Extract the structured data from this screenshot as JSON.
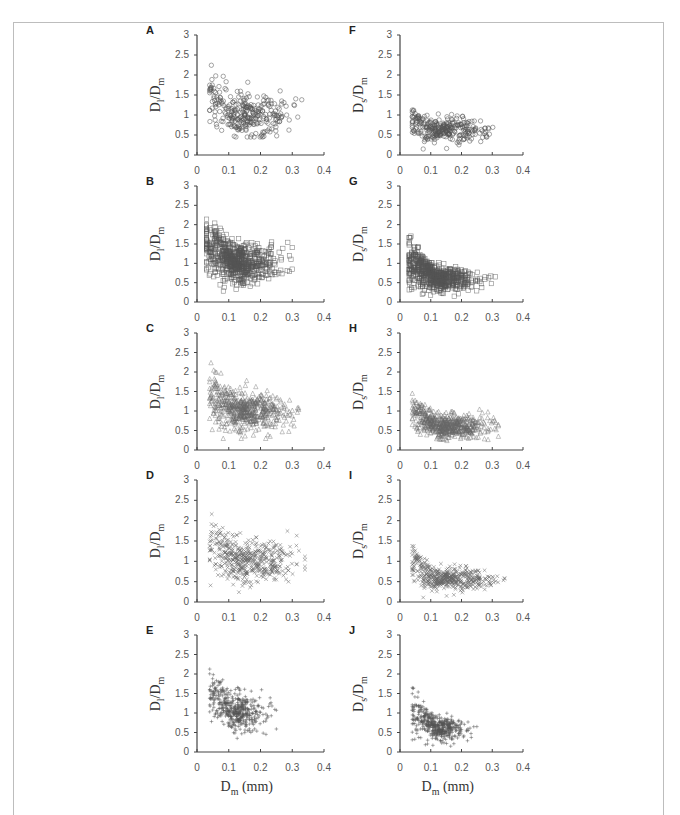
{
  "figure": {
    "x_axis_label_main": "D",
    "x_axis_label_sub": "m",
    "x_axis_label_unit": " (mm)",
    "left_y_main": "D",
    "left_y_sub": "l",
    "left_y_den": "/D",
    "left_y_den_sub": "m",
    "right_y_main": "D",
    "right_y_sub": "s",
    "right_y_den": "/D",
    "right_y_den_sub": "m"
  },
  "chart_data": [
    {
      "panel": "A",
      "type": "scatter",
      "marker": "circle",
      "ylabel": "Dl/Dm",
      "xlabel": "",
      "xlim": [
        0,
        0.4
      ],
      "ylim": [
        0,
        3
      ],
      "xticks": [
        "0",
        "0.1",
        "0.2",
        "0.3",
        "0.4"
      ],
      "yticks": [
        "0",
        "0.5",
        "1",
        "1.5",
        "2",
        "2.5",
        "3"
      ],
      "x_range": [
        0.04,
        0.33
      ],
      "y_range": [
        0.45,
        2.65
      ],
      "center": [
        0.17,
        1.0
      ],
      "description": "Dense cluster near y≈1 for x 0.1–0.3; higher values (up to ~2.65) at x≈0.05–0.1"
    },
    {
      "panel": "B",
      "type": "scatter",
      "marker": "square",
      "ylabel": "Dl/Dm",
      "xlabel": "",
      "xlim": [
        0,
        0.4
      ],
      "ylim": [
        0,
        3
      ],
      "xticks": [
        "0",
        "0.1",
        "0.2",
        "0.3",
        "0.4"
      ],
      "yticks": [
        "0",
        "0.5",
        "1",
        "1.5",
        "2",
        "2.5",
        "3"
      ],
      "x_range": [
        0.03,
        0.3
      ],
      "y_range": [
        0.15,
        2.6
      ],
      "center": [
        0.13,
        1.0
      ],
      "description": "Very dense cluster; decreasing trend from ~2.5 at x≈0.04 to ~1 at x≈0.25"
    },
    {
      "panel": "C",
      "type": "scatter",
      "marker": "triangle",
      "ylabel": "Dl/Dm",
      "xlabel": "",
      "xlim": [
        0,
        0.4
      ],
      "ylim": [
        0,
        3
      ],
      "xticks": [
        "0",
        "0.1",
        "0.2",
        "0.3",
        "0.4"
      ],
      "yticks": [
        "0",
        "0.5",
        "1",
        "1.5",
        "2",
        "2.5",
        "3"
      ],
      "x_range": [
        0.04,
        0.32
      ],
      "y_range": [
        0.3,
        2.65
      ],
      "center": [
        0.17,
        1.0
      ],
      "description": "Dense cluster near y≈1 for x 0.1–0.32; spread to ~2.6 at small x"
    },
    {
      "panel": "D",
      "type": "scatter",
      "marker": "cross",
      "ylabel": "Dl/Dm",
      "xlabel": "",
      "xlim": [
        0,
        0.4
      ],
      "ylim": [
        0,
        3
      ],
      "xticks": [
        "0",
        "0.1",
        "0.2",
        "0.3",
        "0.4"
      ],
      "yticks": [
        "0",
        "0.5",
        "1",
        "1.5",
        "2",
        "2.5",
        "3"
      ],
      "x_range": [
        0.04,
        0.34
      ],
      "y_range": [
        0.2,
        2.7
      ],
      "center": [
        0.19,
        1.0
      ],
      "description": "Decreasing trend; cluster around y≈1 between x 0.15–0.3"
    },
    {
      "panel": "E",
      "type": "scatter",
      "marker": "plus",
      "ylabel": "Dl/Dm",
      "xlabel": "Dm (mm)",
      "xlim": [
        0,
        0.4
      ],
      "ylim": [
        0,
        3
      ],
      "xticks": [
        "0",
        "0.1",
        "0.2",
        "0.3",
        "0.4"
      ],
      "yticks": [
        "0",
        "0.5",
        "1",
        "1.5",
        "2",
        "2.5",
        "3"
      ],
      "x_range": [
        0.04,
        0.25
      ],
      "y_range": [
        0.35,
        2.75
      ],
      "center": [
        0.13,
        1.0
      ],
      "description": "Strong decreasing trend from ~2.7 at x≈0.04 to ~1 at x≈0.2"
    },
    {
      "panel": "F",
      "type": "scatter",
      "marker": "circle",
      "ylabel": "Ds/Dm",
      "xlabel": "",
      "xlim": [
        0,
        0.4
      ],
      "ylim": [
        0,
        3
      ],
      "xticks": [
        "0",
        "0.1",
        "0.2",
        "0.3",
        "0.4"
      ],
      "yticks": [
        "0",
        "0.5",
        "1",
        "1.5",
        "2",
        "2.5",
        "3"
      ],
      "x_range": [
        0.04,
        0.33
      ],
      "y_range": [
        0.15,
        1.25
      ],
      "center": [
        0.17,
        0.6
      ],
      "description": "Cluster around y≈0.6, max ~1.25"
    },
    {
      "panel": "G",
      "type": "scatter",
      "marker": "square",
      "ylabel": "Ds/Dm",
      "xlabel": "",
      "xlim": [
        0,
        0.4
      ],
      "ylim": [
        0,
        3
      ],
      "xticks": [
        "0",
        "0.1",
        "0.2",
        "0.3",
        "0.4"
      ],
      "yticks": [
        "0",
        "0.5",
        "1",
        "1.5",
        "2",
        "2.5",
        "3"
      ],
      "x_range": [
        0.03,
        0.31
      ],
      "y_range": [
        0.05,
        2.05
      ],
      "center": [
        0.13,
        0.6
      ],
      "description": "Very dense cluster around y≈0.6; higher (~2) at small x"
    },
    {
      "panel": "H",
      "type": "scatter",
      "marker": "triangle",
      "ylabel": "Ds/Dm",
      "xlabel": "",
      "xlim": [
        0,
        0.4
      ],
      "ylim": [
        0,
        3
      ],
      "xticks": [
        "0",
        "0.1",
        "0.2",
        "0.3",
        "0.4"
      ],
      "yticks": [
        "0",
        "0.5",
        "1",
        "1.5",
        "2",
        "2.5",
        "3"
      ],
      "x_range": [
        0.04,
        0.32
      ],
      "y_range": [
        0.1,
        2.1
      ],
      "center": [
        0.17,
        0.6
      ],
      "description": "Dense cluster around y≈0.55 from x 0.1–0.3"
    },
    {
      "panel": "I",
      "type": "scatter",
      "marker": "cross",
      "ylabel": "Ds/Dm",
      "xlabel": "",
      "xlim": [
        0,
        0.4
      ],
      "ylim": [
        0,
        3
      ],
      "xticks": [
        "0",
        "0.1",
        "0.2",
        "0.3",
        "0.4"
      ],
      "yticks": [
        "0",
        "0.5",
        "1",
        "1.5",
        "2",
        "2.5",
        "3"
      ],
      "x_range": [
        0.04,
        0.34
      ],
      "y_range": [
        0.1,
        1.85
      ],
      "center": [
        0.18,
        0.55
      ],
      "description": "Cluster around y≈0.55"
    },
    {
      "panel": "J",
      "type": "scatter",
      "marker": "plus",
      "ylabel": "Ds/Dm",
      "xlabel": "Dm (mm)",
      "xlim": [
        0,
        0.4
      ],
      "ylim": [
        0,
        3
      ],
      "xticks": [
        "0",
        "0.1",
        "0.2",
        "0.3",
        "0.4"
      ],
      "yticks": [
        "0",
        "0.5",
        "1",
        "1.5",
        "2",
        "2.5",
        "3"
      ],
      "x_range": [
        0.04,
        0.25
      ],
      "y_range": [
        0.1,
        2.2
      ],
      "center": [
        0.13,
        0.6
      ],
      "description": "Cluster around y≈0.6, max ~2.2 at small x"
    }
  ]
}
